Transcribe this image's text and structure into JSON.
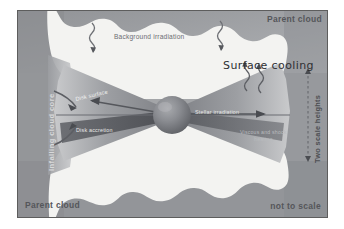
{
  "figure": {
    "background_color": "#9a9a9a",
    "cloud_color": "#f2f2f0",
    "disk_color": "#8d8f93",
    "star_color": "#7c7e83"
  },
  "labels": {
    "parent_cloud_top_right": "Parent cloud",
    "parent_cloud_bottom_left": "Parent cloud",
    "not_to_scale": "not to scale",
    "background_irradiation": "Background irradiation",
    "surface_cooling": "Surface cooling",
    "disk_surface": "Disk surface",
    "disk_accretion": "Disk accretion",
    "stellar_irradiation": "Stellar irradiation",
    "viscous_and_shock_heating_line1": "Viscous and shock",
    "viscous_and_shock_heating_line2": "heating",
    "infalling_cloud_core": "Infalling cloud core",
    "two_scale_heights": "Two scale heights"
  },
  "icons": {
    "wavy_arrow_left": "wavy-arrow-down-icon",
    "wavy_arrow_right": "wavy-arrow-down-icon",
    "cooling_wave_left": "wavy-arrow-up-icon",
    "cooling_wave_right": "wavy-arrow-up-icon",
    "accretion_arrow_left": "arrow-left-icon",
    "irradiation_arrow_right": "arrow-right-icon",
    "infall_arrow_upper": "curved-arrow-icon",
    "infall_arrow_lower": "curved-arrow-icon",
    "scale_height_top_marker": "arrow-up-marker-icon",
    "scale_height_bottom_marker": "arrow-down-marker-icon",
    "protostar": "star-sphere-icon"
  }
}
